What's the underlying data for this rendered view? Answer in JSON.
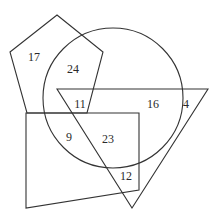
{
  "diagram": {
    "type": "venn-shapes",
    "stroke_color": "#333333",
    "background": "#ffffff",
    "shapes": {
      "pentagon": {
        "points": "57,15 103,52 87,113 27,113 10,52"
      },
      "circle": {
        "cx": 113,
        "cy": 98,
        "r": 70
      },
      "triangle": {
        "points": "57,89 208,89 132,208"
      },
      "quadrilateral": {
        "points": "26,113 139,113 139,190 26,208"
      }
    },
    "regions": [
      {
        "id": "pentagon-only",
        "value": "17",
        "x": 34,
        "y": 57
      },
      {
        "id": "pentagon-circle",
        "value": "24",
        "x": 73,
        "y": 69
      },
      {
        "id": "pentagon-circle-triangle",
        "value": "11",
        "x": 80,
        "y": 104
      },
      {
        "id": "circle-triangle",
        "value": "16",
        "x": 153,
        "y": 104
      },
      {
        "id": "triangle-only",
        "value": "4",
        "x": 186,
        "y": 104
      },
      {
        "id": "circle-quadrilateral",
        "value": "9",
        "x": 69,
        "y": 137
      },
      {
        "id": "circle-triangle-quadrilateral",
        "value": "23",
        "x": 108,
        "y": 139
      },
      {
        "id": "triangle-quadrilateral",
        "value": "12",
        "x": 126,
        "y": 176
      }
    ]
  }
}
